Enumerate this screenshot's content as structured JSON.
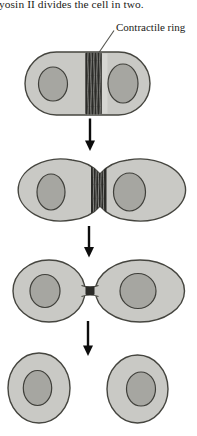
{
  "figure": {
    "caption_fragment": "yosin II divides the cell in two.",
    "labels": {
      "contractile_ring": "Contractile ring"
    }
  },
  "colors": {
    "background": "#ffffff",
    "text": "#1a1a17",
    "leader": "#55554f",
    "cytoplasm": "#c9c9c5",
    "cell_outline": "#45453f",
    "nucleus": "#a6a6a1",
    "nucleus_outline": "#3f3f3a",
    "ring_dark": "#2b2b28",
    "ring_stripe": "#90908c",
    "ring_highlight": "#d6d6d2",
    "arrow": "#0d0d0d"
  }
}
